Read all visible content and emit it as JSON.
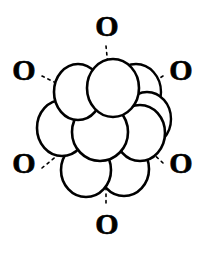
{
  "figure": {
    "title": "",
    "canvas": {
      "width": 210,
      "height": 256,
      "background": "#ffffff"
    },
    "style": {
      "line_color": "#000000",
      "fill_color": "#ffffff",
      "bond_style": "dashed"
    },
    "central_cluster": {
      "label": "sphere-cluster",
      "sphere_count": 12,
      "spheres": [
        {
          "id": "sphere-back-top-right",
          "cx": 136,
          "cy": 92,
          "rx": 25,
          "ry": 28,
          "layer": "back"
        },
        {
          "id": "sphere-back-right",
          "cx": 145,
          "cy": 120,
          "rx": 24,
          "ry": 27,
          "layer": "back"
        },
        {
          "id": "sphere-top-left",
          "cx": 78,
          "cy": 92,
          "rx": 24,
          "ry": 28,
          "layer": "front"
        },
        {
          "id": "sphere-top-center",
          "cx": 113,
          "cy": 88,
          "rx": 25,
          "ry": 29,
          "layer": "front"
        },
        {
          "id": "sphere-mid-left",
          "cx": 63,
          "cy": 128,
          "rx": 25,
          "ry": 28,
          "layer": "front"
        },
        {
          "id": "sphere-mid-center",
          "cx": 100,
          "cy": 132,
          "rx": 27,
          "ry": 29,
          "layer": "front"
        },
        {
          "id": "sphere-mid-right",
          "cx": 140,
          "cy": 133,
          "rx": 25,
          "ry": 28,
          "layer": "front"
        },
        {
          "id": "sphere-bottom-left",
          "cx": 85,
          "cy": 170,
          "rx": 25,
          "ry": 27,
          "layer": "front"
        },
        {
          "id": "sphere-bottom-right",
          "cx": 124,
          "cy": 170,
          "rx": 25,
          "ry": 27,
          "layer": "front"
        }
      ]
    },
    "ligands": [
      {
        "id": "ligand-top",
        "text": "O",
        "x": 92,
        "y": 11,
        "position": "top"
      },
      {
        "id": "ligand-top-left",
        "text": "O",
        "x": 9,
        "y": 55,
        "position": "upper-left"
      },
      {
        "id": "ligand-top-right",
        "text": "O",
        "x": 166,
        "y": 55,
        "position": "upper-right"
      },
      {
        "id": "ligand-bottom-left",
        "text": "O",
        "x": 9,
        "y": 148,
        "position": "lower-left"
      },
      {
        "id": "ligand-bottom-right",
        "text": "O",
        "x": 166,
        "y": 148,
        "position": "lower-right"
      },
      {
        "id": "ligand-bottom",
        "text": "O",
        "x": 92,
        "y": 209,
        "position": "bottom"
      }
    ],
    "bonds": [
      {
        "id": "bond-top",
        "x1": 106,
        "y1": 46,
        "x2": 108,
        "y2": 66,
        "from": "ligand-top",
        "to": "sphere-top-center"
      },
      {
        "id": "bond-top-left",
        "x1": 42,
        "y1": 76,
        "x2": 64,
        "y2": 87,
        "from": "ligand-top-left",
        "to": "sphere-top-left"
      },
      {
        "id": "bond-top-right",
        "x1": 163,
        "y1": 76,
        "x2": 143,
        "y2": 88,
        "from": "ligand-top-right",
        "to": "sphere-back-top-right"
      },
      {
        "id": "bond-bottom-left",
        "x1": 42,
        "y1": 168,
        "x2": 62,
        "y2": 152,
        "from": "ligand-bottom-left",
        "to": "sphere-mid-left"
      },
      {
        "id": "bond-bottom-right",
        "x1": 163,
        "y1": 162,
        "x2": 136,
        "y2": 137,
        "from": "ligand-bottom-right",
        "to": "sphere-mid-right"
      },
      {
        "id": "bond-bottom",
        "x1": 106,
        "y1": 202,
        "x2": 106,
        "y2": 187,
        "from": "ligand-bottom",
        "to": "sphere-bottom-right"
      }
    ]
  }
}
